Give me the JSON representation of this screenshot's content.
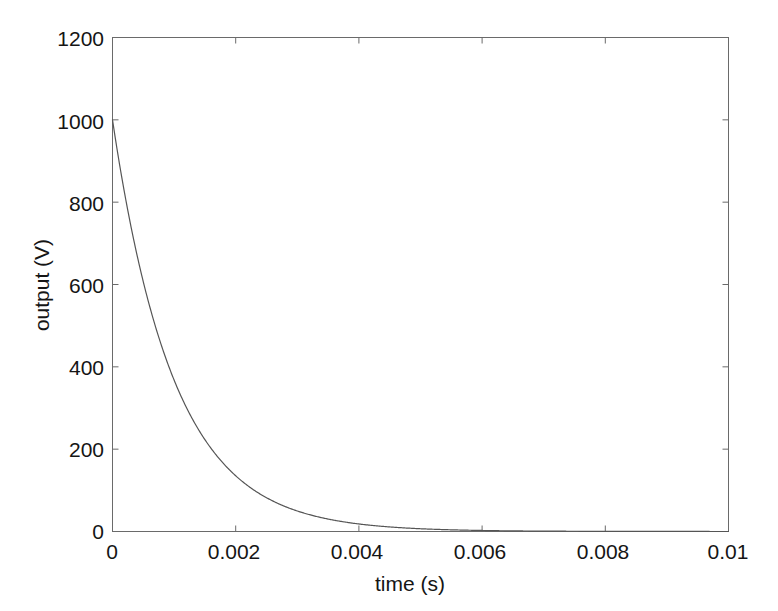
{
  "chart_data": {
    "type": "line",
    "title": "",
    "xlabel": "time (s)",
    "ylabel": "output (V)",
    "xlim": [
      0,
      0.01
    ],
    "ylim": [
      0,
      1200
    ],
    "grid": false,
    "legend": null,
    "xticks": [
      "0",
      "0.002",
      "0.004",
      "0.006",
      "0.008",
      "0.01"
    ],
    "xtick_values": [
      0,
      0.002,
      0.004,
      0.006,
      0.008,
      0.01
    ],
    "yticks": [
      "0",
      "200",
      "400",
      "600",
      "800",
      "1000",
      "1200"
    ],
    "ytick_values": [
      0,
      200,
      400,
      600,
      800,
      1000,
      1200
    ],
    "series": [
      {
        "name": "output",
        "color": "#555555",
        "linewidth": 1,
        "description": "exponential decay, V(t) = 1000 * exp(-t / 0.001)",
        "x": [
          0,
          0.0001,
          0.0002,
          0.0003,
          0.0004,
          0.0005,
          0.0006,
          0.0007,
          0.0008,
          0.0009,
          0.001,
          0.0011,
          0.0012,
          0.0013,
          0.0014,
          0.0015,
          0.0016,
          0.0017,
          0.0018,
          0.0019,
          0.002,
          0.0022,
          0.0024,
          0.0026,
          0.0028,
          0.003,
          0.0032,
          0.0034,
          0.0036,
          0.0038,
          0.004,
          0.0045,
          0.005,
          0.0055,
          0.006,
          0.0065,
          0.007,
          0.0075,
          0.008,
          0.0085,
          0.009,
          0.0095,
          0.01
        ],
        "y": [
          1000,
          904.8,
          818.7,
          740.8,
          670.3,
          606.5,
          548.8,
          496.6,
          449.3,
          406.6,
          367.9,
          332.9,
          301.2,
          272.5,
          246.6,
          223.1,
          201.9,
          182.7,
          165.3,
          149.6,
          135.3,
          110.8,
          90.7,
          74.3,
          60.8,
          49.8,
          40.8,
          33.4,
          27.3,
          22.4,
          18.3,
          11.1,
          6.7,
          4.1,
          2.5,
          1.5,
          0.9,
          0.6,
          0.3,
          0.2,
          0.1,
          0.1,
          0.0
        ]
      }
    ]
  },
  "figure": {
    "background_color": "#ffffff",
    "axis_color": "#6a6a6a",
    "text_color": "#151515"
  }
}
